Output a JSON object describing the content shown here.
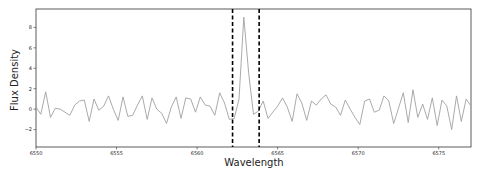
{
  "chart_data": {
    "type": "line",
    "title": "",
    "xlabel": "Wavelength",
    "ylabel": "Flux Density",
    "xlim": [
      6550,
      6577
    ],
    "ylim": [
      -3.7,
      9.8
    ],
    "grid": false,
    "legend": null,
    "xticks": [
      6550,
      6555,
      6560,
      6565,
      6570,
      6575
    ],
    "yticks": [
      -2,
      0,
      2,
      4,
      6,
      8
    ],
    "line_color": "#a0a0a0",
    "vlines": [
      {
        "x": 6562.2,
        "style": "dashed",
        "color": "#000000"
      },
      {
        "x": 6563.85,
        "style": "dashed",
        "color": "#000000"
      }
    ],
    "series": [
      {
        "name": "flux",
        "x": [
          6550.0,
          6550.3,
          6550.6,
          6550.9,
          6551.2,
          6551.5,
          6551.8,
          6552.1,
          6552.4,
          6552.7,
          6553.0,
          6553.3,
          6553.6,
          6553.9,
          6554.2,
          6554.5,
          6554.8,
          6555.1,
          6555.4,
          6555.7,
          6556.0,
          6556.3,
          6556.6,
          6556.9,
          6557.2,
          6557.5,
          6557.8,
          6558.1,
          6558.4,
          6558.7,
          6559.0,
          6559.3,
          6559.6,
          6559.9,
          6560.2,
          6560.5,
          6560.8,
          6561.1,
          6561.4,
          6561.7,
          6562.0,
          6562.3,
          6562.6,
          6562.9,
          6563.2,
          6563.5,
          6563.8,
          6564.1,
          6564.4,
          6564.7,
          6565.0,
          6565.3,
          6565.6,
          6565.9,
          6566.2,
          6566.5,
          6566.8,
          6567.1,
          6567.4,
          6567.7,
          6568.0,
          6568.3,
          6568.6,
          6568.9,
          6569.2,
          6569.5,
          6569.8,
          6570.1,
          6570.4,
          6570.7,
          6571.0,
          6571.3,
          6571.6,
          6571.9,
          6572.2,
          6572.5,
          6572.8,
          6573.1,
          6573.4,
          6573.7,
          6574.0,
          6574.3,
          6574.6,
          6574.9,
          6575.2,
          6575.5,
          6575.8,
          6576.1,
          6576.4,
          6576.7,
          6577.0
        ],
        "y": [
          0.2,
          -0.5,
          1.7,
          -0.8,
          0.1,
          0.0,
          -0.3,
          -0.6,
          0.4,
          0.8,
          0.9,
          -1.2,
          1.0,
          -0.1,
          0.3,
          1.3,
          0.0,
          -1.1,
          1.2,
          -0.7,
          -0.6,
          0.4,
          1.3,
          -1.0,
          1.1,
          0.0,
          -0.4,
          -1.4,
          0.2,
          1.2,
          -0.9,
          1.1,
          1.0,
          -0.3,
          1.2,
          0.4,
          0.3,
          -0.6,
          1.6,
          0.6,
          -1.0,
          -0.9,
          1.0,
          9.0,
          3.5,
          -0.5,
          -0.2,
          0.8,
          -0.9,
          -0.3,
          0.3,
          1.1,
          0.2,
          -1.2,
          1.5,
          0.6,
          -1.1,
          0.8,
          0.4,
          1.0,
          1.4,
          0.5,
          0.2,
          -0.6,
          0.9,
          0.0,
          -0.8,
          -1.5,
          0.8,
          1.0,
          -0.3,
          -0.1,
          1.3,
          0.8,
          -1.4,
          0.1,
          1.6,
          -1.3,
          1.9,
          -0.8,
          0.5,
          -1.0,
          1.1,
          -1.6,
          0.9,
          0.3,
          -2.0,
          1.3,
          -1.2,
          1.0,
          0.3
        ]
      }
    ]
  }
}
